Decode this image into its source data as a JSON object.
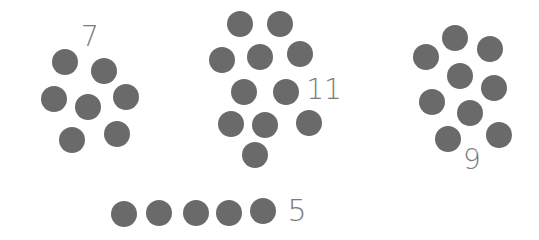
{
  "dot_color": "#6a6a6a",
  "label_color": "#7a7a7a",
  "dot_radius": 13,
  "groups": [
    {
      "label": "7",
      "count": 7,
      "label_pos": [
        90,
        37
      ],
      "label_size": 28,
      "dots": [
        [
          65,
          62
        ],
        [
          104,
          71
        ],
        [
          54,
          99
        ],
        [
          88,
          107
        ],
        [
          126,
          97
        ],
        [
          72,
          140
        ],
        [
          117,
          134
        ]
      ]
    },
    {
      "label": "11",
      "count": 11,
      "label_pos": [
        324,
        90
      ],
      "label_size": 28,
      "dots": [
        [
          240,
          24
        ],
        [
          280,
          24
        ],
        [
          222,
          60
        ],
        [
          260,
          57
        ],
        [
          300,
          54
        ],
        [
          244,
          92
        ],
        [
          286,
          92
        ],
        [
          231,
          124
        ],
        [
          265,
          125
        ],
        [
          309,
          123
        ],
        [
          255,
          155
        ]
      ]
    },
    {
      "label": "9",
      "count": 9,
      "label_pos": [
        472,
        160
      ],
      "label_size": 28,
      "dots": [
        [
          455,
          38
        ],
        [
          490,
          49
        ],
        [
          426,
          57
        ],
        [
          460,
          76
        ],
        [
          494,
          88
        ],
        [
          432,
          102
        ],
        [
          470,
          113
        ],
        [
          448,
          139
        ],
        [
          499,
          135
        ]
      ]
    },
    {
      "label": "5",
      "count": 5,
      "label_pos": [
        297,
        211
      ],
      "label_size": 30,
      "dots": [
        [
          124,
          214
        ],
        [
          159,
          213
        ],
        [
          196,
          213
        ],
        [
          229,
          213
        ],
        [
          263,
          211
        ]
      ]
    }
  ]
}
